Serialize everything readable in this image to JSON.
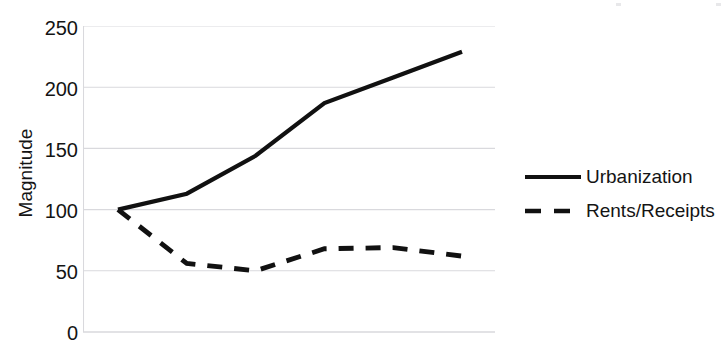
{
  "chart": {
    "ylabel": "Magnitude",
    "yticks": [
      "250",
      "200",
      "150",
      "100",
      "50",
      "0"
    ],
    "legend": [
      {
        "name": "Urbanization",
        "style": "solid"
      },
      {
        "name": "Rents/Receipts",
        "style": "dashed"
      }
    ],
    "colors": {
      "line": "#111111",
      "grid": "#d9d9dd",
      "text": "#141414",
      "background": "#ffffff"
    }
  },
  "chart_data": {
    "type": "line",
    "title": "",
    "xlabel": "",
    "ylabel": "Magnitude",
    "ylim": [
      0,
      250
    ],
    "yticks": [
      0,
      50,
      100,
      150,
      200,
      250
    ],
    "grid": true,
    "legend_position": "right",
    "x": [
      0,
      1,
      2,
      3,
      4,
      5
    ],
    "series": [
      {
        "name": "Urbanization",
        "style": "solid",
        "values": [
          100,
          113,
          144,
          187,
          208,
          229
        ]
      },
      {
        "name": "Rents/Receipts",
        "style": "dashed",
        "values": [
          100,
          56,
          50,
          68,
          69,
          62
        ]
      }
    ]
  }
}
